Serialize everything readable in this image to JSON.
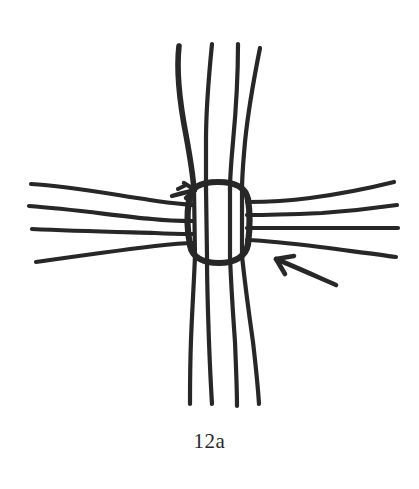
{
  "figure": {
    "caption": "12a",
    "title": "12a",
    "ink_color": "#272727",
    "background_color": "#ffffff",
    "type": "line-drawing",
    "annotations": [
      {
        "name": "upper-left-arrow",
        "label": "",
        "points_to": "top-left of loop",
        "direction": "up-right"
      },
      {
        "name": "lower-right-arrow",
        "label": "",
        "points_to": "bottom-right of loop",
        "direction": "up-left"
      }
    ],
    "elements": {
      "vertical_strand_count": 4,
      "horizontal_strand_count": 4,
      "loop_count": 1
    }
  }
}
